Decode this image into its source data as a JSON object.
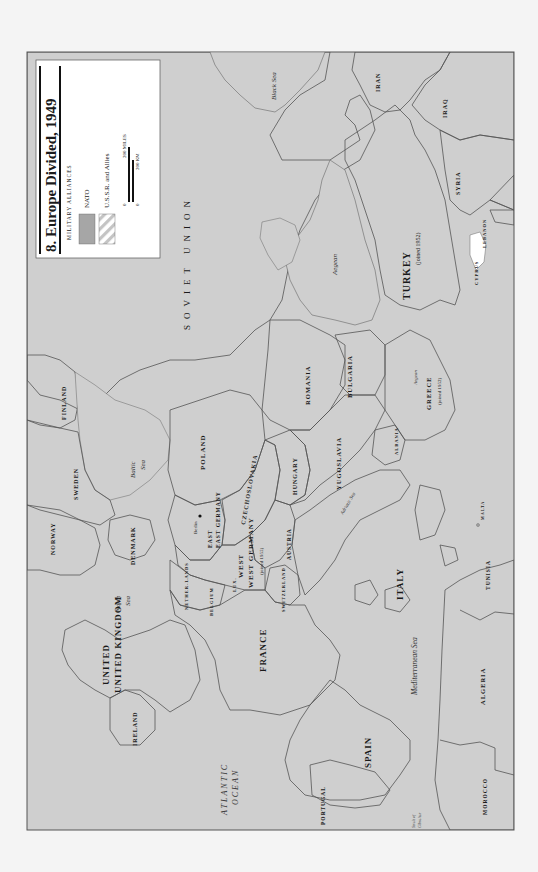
{
  "map": {
    "title": "8. Europe Divided, 1949",
    "legend": {
      "heading": "MILITARY ALLIANCES",
      "items": [
        {
          "label": "NATO",
          "swatch": "nato"
        },
        {
          "label": "U.S.S.R. and Allies",
          "swatch": "ussr"
        }
      ],
      "scale": {
        "miles_zero": "0",
        "miles_label": "200 MILES",
        "km_zero": "0",
        "km_label": "200 KM"
      }
    },
    "colors": {
      "nato": "#a6a6a6",
      "sea": "#cfcfcf",
      "neutral": "#ffffff",
      "ussr_hatch": "#c4c4c4",
      "frame": "#555555",
      "background": "#f4f4f4"
    },
    "nato_countries": [
      {
        "name": "UNITED KINGDOM"
      },
      {
        "name": "FRANCE"
      },
      {
        "name": "ITALY"
      },
      {
        "name": "NORWAY"
      },
      {
        "name": "DENMARK"
      },
      {
        "name": "NETHER-LANDS"
      },
      {
        "name": "BELGIUM"
      },
      {
        "name": "LUX."
      },
      {
        "name": "PORTUGAL"
      },
      {
        "name": "WEST GERMANY",
        "note": "(joined 1955)"
      },
      {
        "name": "GREECE",
        "note": "(joined 1952)"
      },
      {
        "name": "TURKEY",
        "note": "(joined 1952)"
      }
    ],
    "ussr_bloc": [
      {
        "name": "SOVIET UNION"
      },
      {
        "name": "POLAND"
      },
      {
        "name": "EAST GERMANY"
      },
      {
        "name": "CZECHOSLOVAKIA"
      },
      {
        "name": "HUNGARY"
      },
      {
        "name": "ROMANIA"
      },
      {
        "name": "BULGARIA"
      },
      {
        "name": "ALBANIA"
      }
    ],
    "other_countries": [
      {
        "name": "IRELAND"
      },
      {
        "name": "SPAIN"
      },
      {
        "name": "SWEDEN"
      },
      {
        "name": "FINLAND"
      },
      {
        "name": "SWITZERLAND"
      },
      {
        "name": "AUSTRIA"
      },
      {
        "name": "YUGOSLAVIA"
      },
      {
        "name": "MOROCCO"
      },
      {
        "name": "ALGERIA"
      },
      {
        "name": "TUNISIA"
      },
      {
        "name": "MALTA"
      },
      {
        "name": "CYPRUS"
      },
      {
        "name": "LEBANON"
      },
      {
        "name": "SYRIA"
      },
      {
        "name": "IRAQ"
      },
      {
        "name": "IRAN"
      }
    ],
    "cities": [
      {
        "name": "Berlin"
      }
    ],
    "water_bodies": [
      {
        "name": "ATLANTIC",
        "line2": "OCEAN"
      },
      {
        "name": "North",
        "line2": "Sea"
      },
      {
        "name": "Baltic",
        "line2": "Sea"
      },
      {
        "name": "Mediterranean Sea"
      },
      {
        "name": "Adriatic Sea"
      },
      {
        "name": "Aegean",
        "line2": "Sea"
      },
      {
        "name": "Black Sea"
      },
      {
        "name": "Caspian",
        "line2": "Sea"
      },
      {
        "name": "Strait of",
        "line2": "Gibraltar"
      }
    ]
  }
}
